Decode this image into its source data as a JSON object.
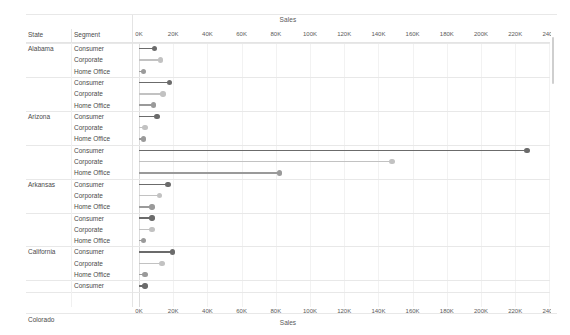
{
  "axis": {
    "title": "Sales",
    "tick_labels": [
      "0K",
      "20K",
      "40K",
      "60K",
      "80K",
      "100K",
      "120K",
      "140K",
      "160K",
      "180K",
      "200K",
      "220K",
      "240K"
    ],
    "min": 0,
    "max": 240000,
    "step": 20000
  },
  "columns": {
    "state_header": "State",
    "segment_header": "Segment"
  },
  "colors": {
    "consumer": "#6b6b6b",
    "corporate": "#c2c2c2",
    "home_office": "#9a9a9a",
    "gridline": "#f2f2f2",
    "row_separator": "#e8e8e8",
    "text": "#4a4a4a"
  },
  "legend_segments": [
    "Consumer",
    "Corporate",
    "Home Office"
  ],
  "chart_data": {
    "type": "bar",
    "subtype": "lollipop-dot-plot",
    "title": "Sales",
    "xlabel": "Sales",
    "ylabel": "State / Segment",
    "xlim": [
      0,
      240000
    ],
    "xticks": [
      0,
      20000,
      40000,
      60000,
      80000,
      100000,
      120000,
      140000,
      160000,
      180000,
      200000,
      220000,
      240000
    ],
    "grid": true,
    "legend": "none",
    "categories": [
      "Consumer",
      "Corporate",
      "Home Office"
    ],
    "rows": [
      {
        "state": "Alabama",
        "segment": "Consumer",
        "value": 9000
      },
      {
        "state": "Alabama",
        "segment": "Corporate",
        "value": 12500
      },
      {
        "state": "Alabama",
        "segment": "Home Office",
        "value": 2500
      },
      {
        "state": "Arizona",
        "segment": "Consumer",
        "value": 18000
      },
      {
        "state": "Arizona",
        "segment": "Corporate",
        "value": 14000
      },
      {
        "state": "Arizona",
        "segment": "Home Office",
        "value": 8500
      },
      {
        "state": "Arkansas",
        "segment": "Consumer",
        "value": 10500
      },
      {
        "state": "Arkansas",
        "segment": "Corporate",
        "value": 3500
      },
      {
        "state": "Arkansas",
        "segment": "Home Office",
        "value": 2500
      },
      {
        "state": "California",
        "segment": "Consumer",
        "value": 227000
      },
      {
        "state": "California",
        "segment": "Corporate",
        "value": 148000
      },
      {
        "state": "California",
        "segment": "Home Office",
        "value": 82000
      },
      {
        "state": "Colorado",
        "segment": "Consumer",
        "value": 17000
      },
      {
        "state": "Colorado",
        "segment": "Corporate",
        "value": 12000
      },
      {
        "state": "Colorado",
        "segment": "Home Office",
        "value": 7500
      },
      {
        "state": "Connecticut",
        "segment": "Consumer",
        "value": 7500
      },
      {
        "state": "Connecticut",
        "segment": "Corporate",
        "value": 7500
      },
      {
        "state": "Connecticut",
        "segment": "Home Office",
        "value": 2500
      },
      {
        "state": "Delaware",
        "segment": "Consumer",
        "value": 19500
      },
      {
        "state": "Delaware",
        "segment": "Corporate",
        "value": 13500
      },
      {
        "state": "Delaware",
        "segment": "Home Office",
        "value": 3500
      },
      {
        "state": "District of Columbia",
        "segment": "Consumer",
        "value": 3500
      }
    ]
  }
}
